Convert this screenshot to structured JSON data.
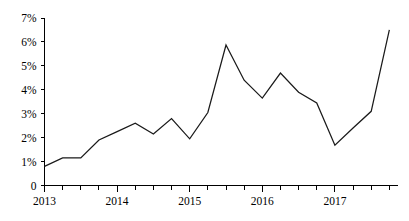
{
  "chart_data": {
    "type": "line",
    "title": "",
    "subtitle": "",
    "xlabel": "",
    "ylabel": "",
    "grid": false,
    "legend": false,
    "legend_position": "none",
    "ylim": [
      0,
      7
    ],
    "y_ticks": [
      0,
      1,
      2,
      3,
      4,
      5,
      6,
      7
    ],
    "y_tick_labels": [
      "0",
      "1%",
      "2%",
      "3%",
      "4%",
      "5%",
      "6%",
      "7%"
    ],
    "x_tick_labels": [
      "2013",
      "2014",
      "2015",
      "2016",
      "2017"
    ],
    "x_minor_ticks_per_year": 4,
    "x": [
      "2013 Q1",
      "2013 Q2",
      "2013 Q3",
      "2013 Q4",
      "2014 Q1",
      "2014 Q2",
      "2014 Q3",
      "2014 Q4",
      "2015 Q1",
      "2015 Q2",
      "2015 Q3",
      "2015 Q4",
      "2016 Q1",
      "2016 Q2",
      "2016 Q3",
      "2016 Q4",
      "2017 Q1",
      "2017 Q2",
      "2017 Q3",
      "2017 Q4"
    ],
    "series": [
      {
        "name": "value",
        "color": "#1a1a1a",
        "values": [
          0.8,
          1.15,
          1.15,
          1.9,
          2.25,
          2.6,
          2.15,
          2.8,
          1.95,
          3.05,
          5.87,
          4.4,
          3.65,
          4.7,
          3.9,
          3.45,
          1.68,
          2.4,
          3.1,
          6.5
        ]
      }
    ],
    "annotations": []
  }
}
